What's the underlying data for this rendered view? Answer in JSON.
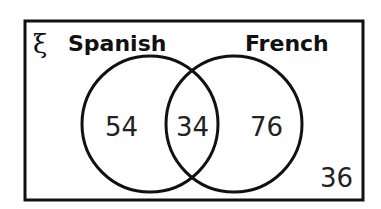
{
  "diagram": {
    "type": "venn",
    "universal_symbol": "ξ",
    "sets": [
      {
        "name": "Spanish",
        "only": "54"
      },
      {
        "name": "French",
        "only": "76"
      }
    ],
    "intersection": "34",
    "outside": "36",
    "colors": {
      "stroke": "#111111",
      "background": "#ffffff"
    }
  }
}
